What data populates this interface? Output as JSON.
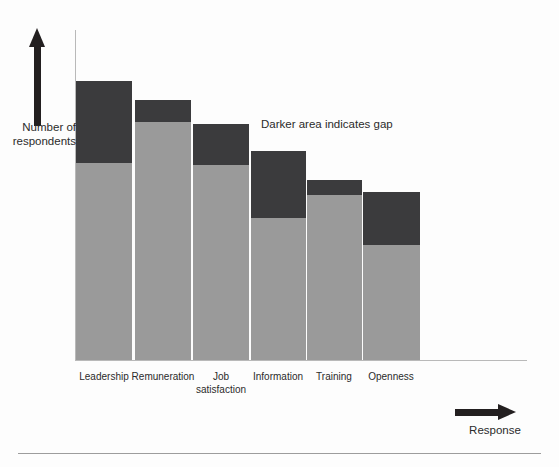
{
  "figure": {
    "annotation": "Darker area indicates gap",
    "y_axis_title_line1": "Number of",
    "y_axis_title_line2": "respondents",
    "x_axis_title": "Response",
    "y_arrow_icon": "up-arrow-icon",
    "x_arrow_icon": "right-arrow-icon"
  },
  "chart_data": {
    "type": "bar",
    "title": "",
    "subtitle": "",
    "xlabel": "Response",
    "ylabel": "Number of respondents",
    "stacked": true,
    "grid": false,
    "legend_position": "none",
    "axis_ticks_shown": false,
    "ylim": [
      0,
      100
    ],
    "categories": [
      "Leadership",
      "Remuneration",
      "Job satisfaction",
      "Information",
      "Training",
      "Openness"
    ],
    "category_labels_wrapped": [
      [
        "Leadership"
      ],
      [
        "Remuneration"
      ],
      [
        "Job",
        "satisfaction"
      ],
      [
        "Information"
      ],
      [
        "Training"
      ],
      [
        "Openness"
      ]
    ],
    "series": [
      {
        "name": "Actual",
        "color": "#9a9a9a",
        "values": [
          60,
          72,
          59,
          43,
          50,
          35
        ]
      },
      {
        "name": "Gap",
        "color": "#3b3b3d",
        "values": [
          25,
          7,
          14,
          20,
          5,
          16
        ]
      }
    ],
    "totals": [
      85,
      79,
      73,
      63,
      55,
      51
    ],
    "annotations": [
      {
        "text": "Darker area indicates gap",
        "target": "gap-series"
      }
    ]
  },
  "geometry": {
    "baseline_y": 360,
    "axis_left_x": 75,
    "axis_right_x": 527,
    "pixels_per_unit": 3.3,
    "bars": [
      {
        "x": 76,
        "w": 56,
        "top": 81,
        "split": 163
      },
      {
        "x": 135,
        "w": 56,
        "top": 100,
        "split": 122
      },
      {
        "x": 193,
        "w": 56,
        "top": 124,
        "split": 165
      },
      {
        "x": 251,
        "w": 55,
        "top": 151,
        "split": 218
      },
      {
        "x": 307,
        "w": 55,
        "top": 180,
        "split": 195
      },
      {
        "x": 363,
        "w": 57,
        "top": 192,
        "split": 245
      }
    ],
    "label_centers": [
      104,
      163,
      221,
      278,
      334,
      391
    ]
  }
}
